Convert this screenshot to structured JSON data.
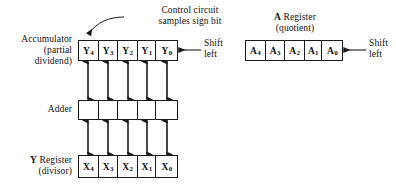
{
  "figure": {
    "type": "block-diagram"
  },
  "annotations": {
    "control_circuit": {
      "line1": "Control circuit",
      "line2": "samples sign bit"
    },
    "accumulator_label": {
      "line1": "Accumulator",
      "line2": "(partial",
      "line3": "dividend)"
    },
    "adder_label": "Adder",
    "y_register_label": {
      "line1_bold": "Y",
      "line1_rest": "Register",
      "line2": "(divisor)"
    },
    "a_register_label": {
      "line1_bold": "A",
      "line1_rest": "Register",
      "line2": "(quotient)"
    },
    "shift_left_accumulator": {
      "line1": "Shift",
      "line2": "left"
    },
    "shift_left_a_register": {
      "line1": "Shift",
      "line2": "left"
    }
  },
  "registers": {
    "accumulator": {
      "name": "Accumulator",
      "cells": [
        {
          "base": "Y",
          "sub": "4"
        },
        {
          "base": "Y",
          "sub": "3"
        },
        {
          "base": "Y",
          "sub": "2"
        },
        {
          "base": "Y",
          "sub": "1"
        },
        {
          "base": "Y",
          "sub": "0"
        }
      ]
    },
    "adder": {
      "name": "Adder",
      "cells": [
        {
          "base": "",
          "sub": ""
        },
        {
          "base": "",
          "sub": ""
        },
        {
          "base": "",
          "sub": ""
        },
        {
          "base": "",
          "sub": ""
        },
        {
          "base": "",
          "sub": ""
        }
      ]
    },
    "y_register": {
      "name": "Y Register",
      "cells": [
        {
          "base": "X",
          "sub": "4"
        },
        {
          "base": "X",
          "sub": "3"
        },
        {
          "base": "X",
          "sub": "2"
        },
        {
          "base": "X",
          "sub": "1"
        },
        {
          "base": "X",
          "sub": "0"
        }
      ]
    },
    "a_register": {
      "name": "A Register",
      "cells": [
        {
          "base": "A",
          "sub": "4"
        },
        {
          "base": "A",
          "sub": "3"
        },
        {
          "base": "A",
          "sub": "2"
        },
        {
          "base": "A",
          "sub": "1"
        },
        {
          "base": "A",
          "sub": "0"
        }
      ]
    }
  },
  "colors": {
    "stroke": "#1a1a1a",
    "text": "#111111",
    "background": "#ffffff"
  }
}
